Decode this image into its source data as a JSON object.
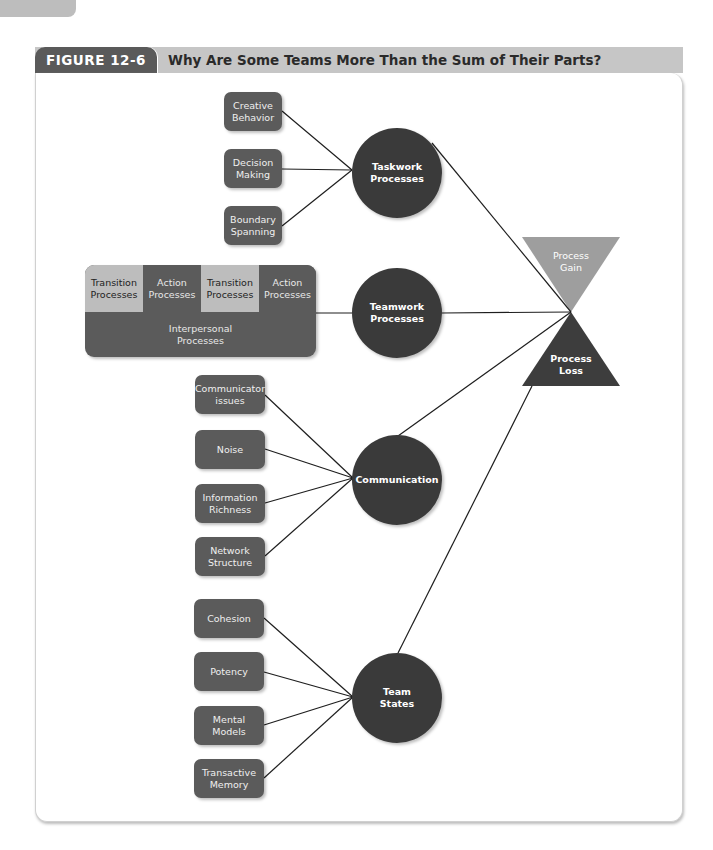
{
  "figure": {
    "label": "FIGURE 12-6",
    "title": "Why Are Some Teams More Than the Sum of Their Parts?"
  },
  "colors": {
    "node_dark": "#3a3a3a",
    "box": "#5b5b5b",
    "light_cell": "#bdbdbd",
    "process_gain": "#9e9e9e",
    "process_loss": "#3d3d3d",
    "header_bg": "#c6c6c6"
  },
  "taskwork": {
    "label": "Taskwork\nProcesses",
    "inputs": [
      "Creative\nBehavior",
      "Decision\nMaking",
      "Boundary\nSpanning"
    ]
  },
  "teamwork": {
    "label": "Teamwork\nProcesses",
    "cells": [
      "Transition\nProcesses",
      "Action\nProcesses",
      "Transition\nProcesses",
      "Action\nProcesses"
    ],
    "interpersonal": "Interpersonal\nProcesses"
  },
  "communication": {
    "label": "Communication",
    "inputs": [
      "Communicator\nissues",
      "Noise",
      "Information\nRichness",
      "Network\nStructure"
    ]
  },
  "team_states": {
    "label": "Team\nStates",
    "inputs": [
      "Cohesion",
      "Potency",
      "Mental\nModels",
      "Transactive\nMemory"
    ]
  },
  "outcomes": {
    "gain": "Process\nGain",
    "loss": "Process\nLoss"
  }
}
